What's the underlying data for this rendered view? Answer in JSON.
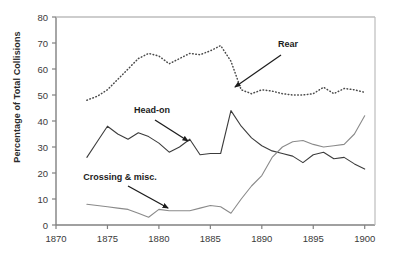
{
  "chart_data": {
    "type": "line",
    "title": "",
    "xlabel": "",
    "ylabel": "Percentage of Total Collisions",
    "xlim": [
      1870,
      1901
    ],
    "ylim": [
      0,
      80
    ],
    "grid": false,
    "legend_position": "inline-annotations",
    "yticks": [
      0,
      10,
      20,
      30,
      40,
      50,
      60,
      70,
      80
    ],
    "xticks": [
      1870,
      1875,
      1880,
      1885,
      1890,
      1895,
      1900
    ],
    "series": [
      {
        "name": "Rear",
        "style": "dotted",
        "color": "#4a4a4a",
        "x": [
          1873,
          1874,
          1875,
          1876,
          1877,
          1878,
          1879,
          1880,
          1881,
          1882,
          1883,
          1884,
          1885,
          1886,
          1887,
          1888,
          1889,
          1890,
          1891,
          1892,
          1893,
          1894,
          1895,
          1896,
          1897,
          1898,
          1899,
          1900
        ],
        "values": [
          48,
          49.5,
          52,
          56,
          60,
          64,
          66,
          65,
          62,
          64,
          66,
          65.5,
          67,
          69,
          63,
          52,
          50.5,
          52,
          51.5,
          50.5,
          50,
          50,
          50.5,
          53,
          50.5,
          52.5,
          52,
          51
        ]
      },
      {
        "name": "Head-on",
        "style": "solid",
        "color": "#3c3c3c",
        "x": [
          1873,
          1874,
          1875,
          1876,
          1877,
          1878,
          1879,
          1880,
          1881,
          1882,
          1883,
          1884,
          1885,
          1886,
          1887,
          1888,
          1889,
          1890,
          1891,
          1892,
          1893,
          1894,
          1895,
          1896,
          1897,
          1898,
          1899,
          1900
        ],
        "values": [
          26,
          32,
          38,
          35,
          33,
          35.5,
          34,
          31.5,
          28,
          30,
          33,
          27,
          27.5,
          27.5,
          44,
          38,
          33.5,
          30.5,
          28.5,
          27.5,
          26.5,
          24,
          27,
          28,
          25.5,
          26,
          23.5,
          21.5
        ]
      },
      {
        "name": "Crossing & misc.",
        "style": "solid",
        "color": "#8a8a8a",
        "x": [
          1873,
          1874,
          1875,
          1876,
          1877,
          1878,
          1879,
          1880,
          1881,
          1882,
          1883,
          1884,
          1885,
          1886,
          1887,
          1888,
          1889,
          1890,
          1891,
          1892,
          1893,
          1894,
          1895,
          1896,
          1897,
          1898,
          1899,
          1900
        ],
        "values": [
          8,
          7.5,
          7,
          6.5,
          6,
          4.5,
          3,
          6,
          5.5,
          5.5,
          5.5,
          6.5,
          7.5,
          7,
          4.5,
          10,
          15,
          19,
          26,
          30,
          32,
          32.5,
          31,
          30,
          30.5,
          31,
          35,
          42
        ]
      }
    ],
    "annotations": [
      {
        "label": "Rear",
        "label_x": 288,
        "label_y": 44,
        "arrow_from_x": 281,
        "arrow_from_y": 55,
        "arrow_to_x": 235,
        "arrow_to_y": 87
      },
      {
        "label": "Head-on",
        "label_x": 152,
        "label_y": 110,
        "arrow_from_x": 155,
        "arrow_from_y": 120,
        "arrow_to_x": 188,
        "arrow_to_y": 141
      },
      {
        "label": "Crossing & misc.",
        "label_x": 120,
        "label_y": 177,
        "arrow_from_x": 128,
        "arrow_from_y": 186,
        "arrow_to_x": 168,
        "arrow_to_y": 208
      }
    ]
  },
  "axis": {
    "yticks": [
      "80",
      "70",
      "60",
      "50",
      "40",
      "30",
      "20",
      "10",
      "0"
    ],
    "xticks": [
      "1870",
      "1875",
      "1880",
      "1885",
      "1890",
      "1895",
      "1900"
    ],
    "ylabel": "Percentage of Total Collisions"
  },
  "colors": {
    "rear": "#4a4a4a",
    "headon": "#3c3c3c",
    "crossing": "#8a8a8a",
    "axis": "#808080",
    "text": "#2b2b2b"
  }
}
